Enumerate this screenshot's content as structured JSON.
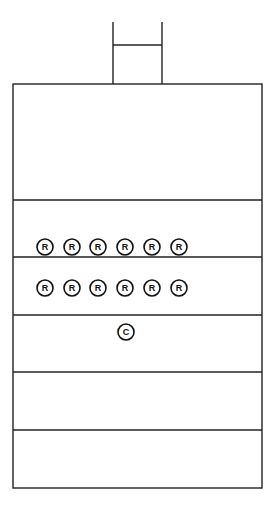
{
  "diagram": {
    "stroke_color": "#222222",
    "background": "#ffffff",
    "chimney": {
      "x1": 113,
      "x2": 162,
      "top": 22,
      "crossbar_y": 45,
      "bottom": 84
    },
    "outer_box": {
      "left": 13,
      "right": 262,
      "top": 84,
      "bottom": 488
    },
    "dividers_y": [
      200,
      257,
      315,
      372,
      430
    ],
    "markers": {
      "row1": {
        "y": 247,
        "label": "R",
        "xs": [
          45,
          72,
          98,
          125,
          152,
          179
        ]
      },
      "row2": {
        "y": 288,
        "label": "R",
        "xs": [
          45,
          72,
          98,
          125,
          152,
          179
        ]
      },
      "row3": {
        "y": 332,
        "label": "C",
        "xs": [
          126
        ]
      }
    },
    "r_labels": [
      "R",
      "R",
      "R",
      "R",
      "R",
      "R",
      "R",
      "R",
      "R",
      "R",
      "R",
      "R"
    ],
    "c_label": "C"
  }
}
